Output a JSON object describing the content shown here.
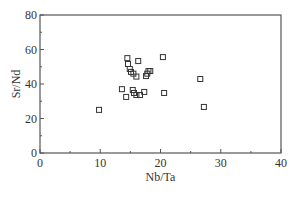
{
  "chart_data": {
    "type": "scatter",
    "title": "",
    "xlabel": "Nb/Ta",
    "ylabel": "Sr/Nd",
    "xlim": [
      0,
      40
    ],
    "ylim": [
      0,
      80
    ],
    "xticks": [
      0,
      10,
      20,
      30,
      40
    ],
    "yticks": [
      0,
      20,
      40,
      60,
      80
    ],
    "x_minor_step": 5,
    "y_minor_step": 10,
    "grid": false,
    "legend": null,
    "marker": "open-square",
    "series": [
      {
        "name": "samples",
        "points": [
          {
            "x": 9.8,
            "y": 25.0
          },
          {
            "x": 14.5,
            "y": 55.0
          },
          {
            "x": 14.6,
            "y": 51.6
          },
          {
            "x": 14.9,
            "y": 48.7
          },
          {
            "x": 15.1,
            "y": 47.0
          },
          {
            "x": 15.5,
            "y": 46.0
          },
          {
            "x": 16.0,
            "y": 44.3
          },
          {
            "x": 16.3,
            "y": 53.3
          },
          {
            "x": 17.6,
            "y": 44.6
          },
          {
            "x": 17.8,
            "y": 46.0
          },
          {
            "x": 18.0,
            "y": 47.5
          },
          {
            "x": 18.3,
            "y": 47.5
          },
          {
            "x": 13.6,
            "y": 37.0
          },
          {
            "x": 14.3,
            "y": 32.5
          },
          {
            "x": 15.4,
            "y": 36.5
          },
          {
            "x": 15.6,
            "y": 34.8
          },
          {
            "x": 16.0,
            "y": 33.6
          },
          {
            "x": 16.6,
            "y": 33.6
          },
          {
            "x": 17.3,
            "y": 35.4
          },
          {
            "x": 20.4,
            "y": 55.6
          },
          {
            "x": 20.6,
            "y": 34.8
          },
          {
            "x": 26.6,
            "y": 42.9
          },
          {
            "x": 27.2,
            "y": 26.7
          }
        ]
      }
    ]
  }
}
